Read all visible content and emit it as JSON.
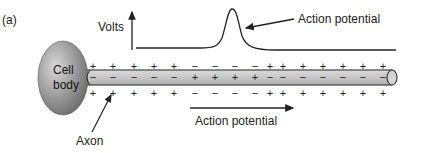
{
  "figure": {
    "panel_label": "(a)",
    "y_axis_label": "Volts",
    "cell_body_label_line1": "Cell",
    "cell_body_label_line2": "body",
    "axon_label": "Axon",
    "action_potential_curve_label": "Action potential",
    "propagation_arrow_label": "Action potential"
  },
  "colors": {
    "cell_body_gradient": [
      "#d8d8d8",
      "#6e6e6e"
    ],
    "axon_fill": "#c9c9c9",
    "ink": "#222222"
  },
  "signs": {
    "top_outside": [
      "+",
      "+",
      "+",
      "+",
      "+",
      "−",
      "−",
      "−",
      "−",
      "+",
      "+",
      "+",
      "+",
      "+",
      "+",
      "+"
    ],
    "inside": [
      "−",
      "−",
      "−",
      "−",
      "−",
      "+",
      "+",
      "+",
      "+",
      "−",
      "−",
      "−",
      "−",
      "−",
      "−",
      "−"
    ],
    "bottom_outside": [
      "+",
      "+",
      "+",
      "+",
      "+",
      "−",
      "−",
      "−",
      "−",
      "+",
      "+",
      "+",
      "+",
      "+",
      "+",
      "+"
    ]
  }
}
